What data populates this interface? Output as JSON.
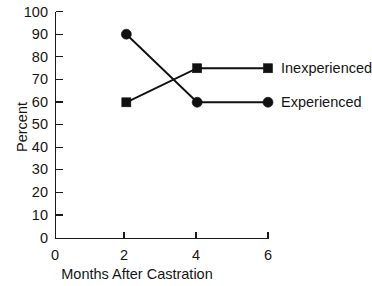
{
  "chart_data": {
    "type": "line",
    "title": "",
    "xlabel": "Months After Castration",
    "ylabel": "Percent",
    "xlim": [
      0,
      6
    ],
    "ylim": [
      0,
      100
    ],
    "xticks": [
      0,
      2,
      4,
      6
    ],
    "yticks": [
      0,
      10,
      20,
      30,
      40,
      50,
      60,
      70,
      80,
      90,
      100
    ],
    "grid": false,
    "legend_position": "right-of-last-point",
    "x": [
      2,
      4,
      6
    ],
    "series": [
      {
        "name": "Inexperienced",
        "marker": "square",
        "color": "#111111",
        "values": [
          60,
          75,
          75
        ]
      },
      {
        "name": "Experienced",
        "marker": "circle",
        "color": "#111111",
        "values": [
          90,
          60,
          60
        ]
      }
    ]
  },
  "axes": {
    "y_title": "Percent",
    "x_title": "Months After Castration",
    "y_tick_labels": [
      "100",
      "90",
      "80",
      "70",
      "60",
      "50",
      "40",
      "30",
      "20",
      "10",
      "0"
    ],
    "x_tick_labels": [
      "0",
      "2",
      "4",
      "6"
    ]
  },
  "legend": {
    "entries": [
      {
        "label": "Inexperienced",
        "marker": "square"
      },
      {
        "label": "Experienced",
        "marker": "circle"
      }
    ]
  },
  "colors": {
    "ink": "#111111",
    "axis": "#1a1a1a",
    "background": "#ffffff"
  }
}
